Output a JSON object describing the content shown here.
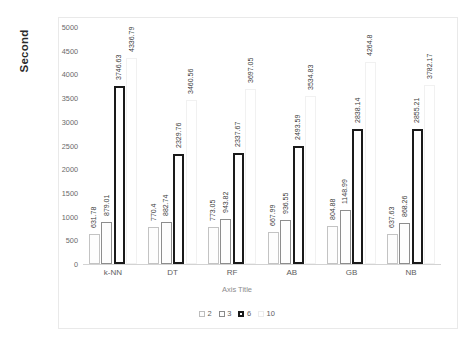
{
  "chart_data": {
    "type": "bar",
    "title": "",
    "xlabel": "Axis Title",
    "ylabel": "Second",
    "ylim": [
      0,
      5000
    ],
    "ytick_step": 500,
    "yticks": [
      "5000",
      "4500",
      "4000",
      "3500",
      "3000",
      "2500",
      "2000",
      "1500",
      "1000",
      "500",
      "0"
    ],
    "grid": false,
    "legend_position": "bottom",
    "categories": [
      "k-NN",
      "DT",
      "RF",
      "AB",
      "GB",
      "NB"
    ],
    "series": [
      {
        "name": "2",
        "values": [
          631.78,
          770.4,
          773.05,
          667.99,
          804.88,
          637.63
        ]
      },
      {
        "name": "3",
        "values": [
          879.01,
          882.74,
          943.82,
          936.55,
          1148.99,
          868.26
        ]
      },
      {
        "name": "6",
        "values": [
          3746.63,
          2329.76,
          2337.67,
          2493.59,
          2838.14,
          2855.21
        ]
      },
      {
        "name": "10",
        "values": [
          4336.79,
          3460.56,
          3697.05,
          3534.83,
          4264.8,
          3782.17
        ]
      }
    ],
    "value_labels": [
      [
        "631.78",
        "879.01",
        "3746.63",
        "4336.79"
      ],
      [
        "770.4",
        "882.74",
        "2329.76",
        "3460.56"
      ],
      [
        "773.05",
        "943.82",
        "2337.67",
        "3697.05"
      ],
      [
        "667.99",
        "936.55",
        "2493.59",
        "3534.83"
      ],
      [
        "804.88",
        "1148.99",
        "2838.14",
        "4264.8"
      ],
      [
        "637.63",
        "868.26",
        "2855.21",
        "3782.17"
      ]
    ],
    "colors": {
      "series_2_border": "#c3c3c3",
      "series_3_border": "#8d8d8d",
      "series_6_border": "#1a1a1a",
      "series_10_border": "#f1f1f1",
      "axis": "#d3d3d3",
      "text": "#5e5e5e",
      "frame": "#e9e9e9"
    }
  }
}
